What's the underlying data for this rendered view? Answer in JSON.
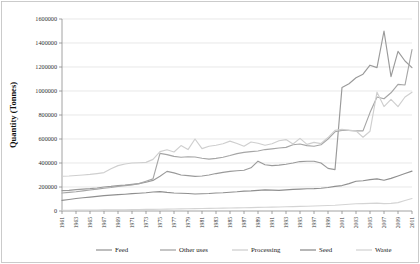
{
  "chart_data": {
    "type": "line",
    "title": "",
    "xlabel": "",
    "ylabel": "Quantity (Tonnes)",
    "ylim": [
      0,
      1600000
    ],
    "ytick_labels": [
      "0",
      "200000",
      "400000",
      "600000",
      "800000",
      "1000000",
      "1200000",
      "1400000",
      "1600000"
    ],
    "ytick_values": [
      0,
      200000,
      400000,
      600000,
      800000,
      1000000,
      1200000,
      1400000,
      1600000
    ],
    "grid": true,
    "legend_position": "bottom",
    "x": [
      1961,
      1962,
      1963,
      1964,
      1965,
      1966,
      1967,
      1968,
      1969,
      1970,
      1971,
      1972,
      1973,
      1974,
      1975,
      1976,
      1977,
      1978,
      1979,
      1980,
      1981,
      1982,
      1983,
      1984,
      1985,
      1986,
      1987,
      1988,
      1989,
      1990,
      1991,
      1992,
      1993,
      1994,
      1995,
      1996,
      1997,
      1998,
      1999,
      2000,
      2001,
      2002,
      2003,
      2004,
      2005,
      2006,
      2007,
      2008,
      2009,
      2010,
      2011
    ],
    "xtick_labels": [
      "1961",
      "1963",
      "1965",
      "1967",
      "1969",
      "1971",
      "1973",
      "1975",
      "1977",
      "1979",
      "1981",
      "1983",
      "1985",
      "1987",
      "1989",
      "1991",
      "1993",
      "1995",
      "1997",
      "1999",
      "2001",
      "2003",
      "2005",
      "2007",
      "2009",
      "2011"
    ],
    "series": [
      {
        "name": "Feed",
        "color": "#9a9a9a",
        "values": [
          170000,
          172000,
          178000,
          182000,
          186000,
          192000,
          200000,
          205000,
          212000,
          216000,
          222000,
          228000,
          240000,
          255000,
          290000,
          330000,
          318000,
          300000,
          295000,
          288000,
          292000,
          300000,
          312000,
          322000,
          330000,
          335000,
          340000,
          360000,
          415000,
          385000,
          378000,
          382000,
          390000,
          400000,
          412000,
          415000,
          415000,
          400000,
          355000,
          345000,
          1030000,
          1060000,
          1110000,
          1140000,
          1215000,
          1195000,
          1500000,
          1120000,
          1330000,
          1250000,
          1195000
        ]
      },
      {
        "name": "Other uses",
        "color": "#a6a6a6",
        "values": [
          150000,
          155000,
          160000,
          168000,
          175000,
          182000,
          190000,
          196000,
          205000,
          212000,
          218000,
          228000,
          248000,
          268000,
          480000,
          470000,
          455000,
          448000,
          452000,
          450000,
          440000,
          432000,
          438000,
          448000,
          462000,
          478000,
          488000,
          495000,
          500000,
          512000,
          518000,
          525000,
          530000,
          552000,
          558000,
          545000,
          540000,
          552000,
          600000,
          660000,
          672000,
          672000,
          668000,
          668000,
          820000,
          950000,
          935000,
          985000,
          1055000,
          1050000,
          1345000
        ]
      },
      {
        "name": "Processing",
        "color": "#cfcfcf",
        "values": [
          290000,
          292000,
          296000,
          300000,
          305000,
          312000,
          320000,
          352000,
          378000,
          392000,
          400000,
          402000,
          405000,
          430000,
          495000,
          510000,
          492000,
          545000,
          512000,
          600000,
          520000,
          540000,
          548000,
          560000,
          582000,
          562000,
          540000,
          575000,
          565000,
          548000,
          560000,
          585000,
          595000,
          558000,
          605000,
          555000,
          572000,
          562000,
          612000,
          672000,
          680000,
          672000,
          668000,
          615000,
          665000,
          990000,
          870000,
          930000,
          870000,
          950000,
          990000
        ]
      },
      {
        "name": "Seed",
        "color": "#8f8f8f",
        "values": [
          88000,
          96000,
          104000,
          110000,
          116000,
          122000,
          128000,
          132000,
          136000,
          140000,
          145000,
          148000,
          152000,
          158000,
          162000,
          155000,
          150000,
          148000,
          146000,
          142000,
          144000,
          146000,
          150000,
          152000,
          156000,
          160000,
          166000,
          168000,
          172000,
          176000,
          174000,
          172000,
          176000,
          180000,
          182000,
          185000,
          186000,
          190000,
          196000,
          205000,
          212000,
          228000,
          248000,
          252000,
          262000,
          268000,
          256000,
          272000,
          292000,
          312000,
          332000
        ]
      },
      {
        "name": "Waste",
        "color": "#d4d4d4",
        "values": [
          6000,
          6500,
          7000,
          7500,
          8000,
          8500,
          9000,
          9500,
          10000,
          10500,
          11000,
          12000,
          13000,
          14000,
          15000,
          16000,
          17000,
          18000,
          19000,
          20000,
          21000,
          22000,
          23000,
          24000,
          25000,
          26000,
          27000,
          28000,
          30000,
          31000,
          32000,
          33000,
          35000,
          36000,
          38000,
          40000,
          42000,
          44000,
          46000,
          48000,
          52000,
          56000,
          60000,
          62000,
          64000,
          66000,
          62000,
          64000,
          70000,
          88000,
          104000
        ]
      }
    ]
  },
  "legend": {
    "items": [
      {
        "label": "Feed"
      },
      {
        "label": "Other uses"
      },
      {
        "label": "Processing"
      },
      {
        "label": "Seed"
      },
      {
        "label": "Waste"
      }
    ]
  }
}
